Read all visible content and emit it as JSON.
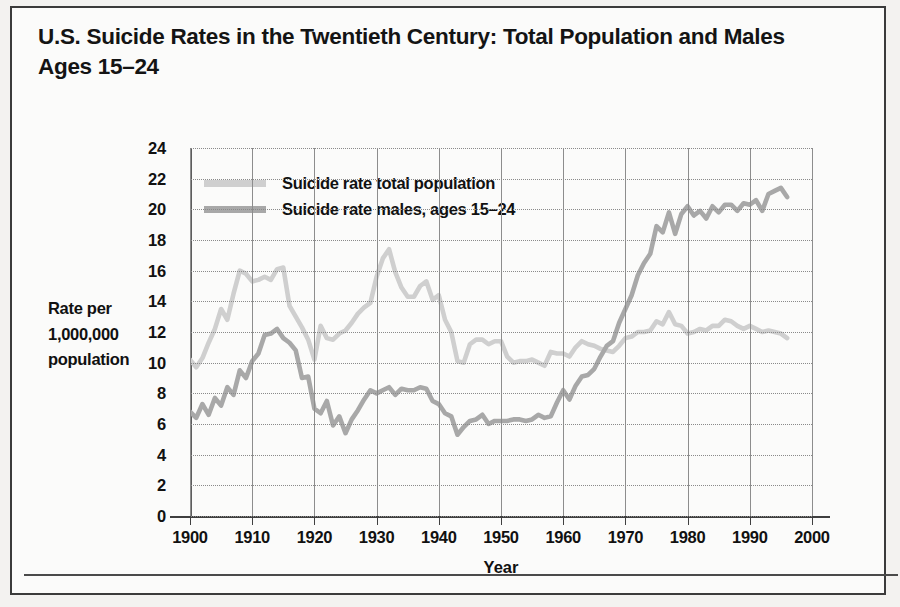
{
  "page": {
    "title": "U.S. Suicide Rates in the Twentieth Century: Total Population and Males Ages 15–24"
  },
  "chart_data": {
    "type": "line",
    "title": "U.S. Suicide Rates in the Twentieth Century: Total Population and Males Ages 15–24",
    "xlabel": "Year",
    "ylabel": "Rate per 1,000,000 population",
    "xlim": [
      1900,
      2000
    ],
    "ylim": [
      0,
      24
    ],
    "xticks": [
      1900,
      1910,
      1920,
      1930,
      1940,
      1950,
      1960,
      1970,
      1980,
      1990,
      2000
    ],
    "yticks": [
      0,
      2,
      4,
      6,
      8,
      10,
      12,
      14,
      16,
      18,
      20,
      22,
      24
    ],
    "grid": "vertical solid, horizontal dotted",
    "legend_position": "top-left inside plot",
    "colors": {
      "total_population": "#cfcfcf",
      "males_15_24": "#a8a8a8",
      "axis": "#3f3f3f",
      "gridline_vertical": "#8d8d8d",
      "gridline_horizontal": "#8a8a8a",
      "text": "#111111",
      "card_background": "#fbfbfa",
      "page_background": "#f3f2f0",
      "border": "#3b3b3b"
    },
    "series": [
      {
        "name": "Suicide rate total population",
        "color": "#cfcfcf",
        "x": [
          1900,
          1901,
          1902,
          1903,
          1904,
          1905,
          1906,
          1907,
          1908,
          1909,
          1910,
          1911,
          1912,
          1913,
          1914,
          1915,
          1916,
          1917,
          1918,
          1919,
          1920,
          1921,
          1922,
          1923,
          1924,
          1925,
          1926,
          1927,
          1928,
          1929,
          1930,
          1931,
          1932,
          1933,
          1934,
          1935,
          1936,
          1937,
          1938,
          1939,
          1940,
          1941,
          1942,
          1943,
          1944,
          1945,
          1946,
          1947,
          1948,
          1949,
          1950,
          1951,
          1952,
          1953,
          1954,
          1955,
          1956,
          1957,
          1958,
          1959,
          1960,
          1961,
          1962,
          1963,
          1964,
          1965,
          1966,
          1967,
          1968,
          1969,
          1970,
          1971,
          1972,
          1973,
          1974,
          1975,
          1976,
          1977,
          1978,
          1979,
          1980,
          1981,
          1982,
          1983,
          1984,
          1985,
          1986,
          1987,
          1988,
          1989,
          1990,
          1991,
          1992,
          1993,
          1994,
          1995,
          1996
        ],
        "y": [
          10.2,
          9.7,
          10.3,
          11.3,
          12.2,
          13.5,
          12.8,
          14.5,
          16.0,
          15.8,
          15.3,
          15.4,
          15.6,
          15.4,
          16.1,
          16.2,
          13.7,
          13.0,
          12.3,
          11.5,
          10.2,
          12.4,
          11.6,
          11.5,
          11.9,
          12.1,
          12.6,
          13.2,
          13.6,
          13.9,
          15.6,
          16.8,
          17.4,
          15.9,
          14.9,
          14.3,
          14.3,
          15.0,
          15.3,
          14.1,
          14.4,
          12.8,
          12.0,
          10.1,
          10.0,
          11.2,
          11.5,
          11.5,
          11.2,
          11.4,
          11.4,
          10.4,
          10.0,
          10.1,
          10.1,
          10.2,
          10.0,
          9.8,
          10.7,
          10.6,
          10.6,
          10.4,
          11.0,
          11.4,
          11.2,
          11.1,
          10.9,
          10.8,
          10.7,
          11.1,
          11.6,
          11.7,
          12.0,
          12.0,
          12.1,
          12.7,
          12.5,
          13.3,
          12.5,
          12.4,
          11.9,
          12.0,
          12.2,
          12.1,
          12.4,
          12.4,
          12.8,
          12.7,
          12.4,
          12.2,
          12.4,
          12.2,
          12.0,
          12.1,
          12.0,
          11.9,
          11.6
        ]
      },
      {
        "name": "Suicide rate males, ages 15–24",
        "color": "#a8a8a8",
        "x": [
          1900,
          1901,
          1902,
          1903,
          1904,
          1905,
          1906,
          1907,
          1908,
          1909,
          1910,
          1911,
          1912,
          1913,
          1914,
          1915,
          1916,
          1917,
          1918,
          1919,
          1920,
          1921,
          1922,
          1923,
          1924,
          1925,
          1926,
          1927,
          1928,
          1929,
          1930,
          1931,
          1932,
          1933,
          1934,
          1935,
          1936,
          1937,
          1938,
          1939,
          1940,
          1941,
          1942,
          1943,
          1944,
          1945,
          1946,
          1947,
          1948,
          1949,
          1950,
          1951,
          1952,
          1953,
          1954,
          1955,
          1956,
          1957,
          1958,
          1959,
          1960,
          1961,
          1962,
          1963,
          1964,
          1965,
          1966,
          1967,
          1968,
          1969,
          1970,
          1971,
          1972,
          1973,
          1974,
          1975,
          1976,
          1977,
          1978,
          1979,
          1980,
          1981,
          1982,
          1983,
          1984,
          1985,
          1986,
          1987,
          1988,
          1989,
          1990,
          1991,
          1992,
          1993,
          1994,
          1995,
          1996
        ],
        "y": [
          6.8,
          6.4,
          7.3,
          6.6,
          7.7,
          7.2,
          8.4,
          7.9,
          9.5,
          9.0,
          10.1,
          10.6,
          11.8,
          11.9,
          12.2,
          11.6,
          11.3,
          10.8,
          9.0,
          9.1,
          7.0,
          6.7,
          7.5,
          5.9,
          6.5,
          5.4,
          6.3,
          6.9,
          7.6,
          8.2,
          8.0,
          8.2,
          8.4,
          7.9,
          8.3,
          8.2,
          8.2,
          8.4,
          8.3,
          7.5,
          7.3,
          6.7,
          6.5,
          5.3,
          5.8,
          6.2,
          6.3,
          6.6,
          6.0,
          6.2,
          6.2,
          6.2,
          6.3,
          6.3,
          6.2,
          6.3,
          6.6,
          6.4,
          6.5,
          7.4,
          8.2,
          7.6,
          8.5,
          9.1,
          9.2,
          9.6,
          10.4,
          11.1,
          11.4,
          12.6,
          13.5,
          14.4,
          15.7,
          16.5,
          17.1,
          18.9,
          18.5,
          19.8,
          18.4,
          19.7,
          20.2,
          19.6,
          19.9,
          19.4,
          20.2,
          19.8,
          20.3,
          20.3,
          19.9,
          20.4,
          20.3,
          20.6,
          19.9,
          21.0,
          21.2,
          21.4,
          20.8
        ]
      }
    ]
  },
  "legend": {
    "items": [
      {
        "label": "Suicide rate total population",
        "color": "#cfcfcf"
      },
      {
        "label": "Suicide rate males, ages 15–24",
        "color": "#a8a8a8"
      }
    ]
  },
  "axes": {
    "y_title_lines": [
      "Rate per",
      "1,000,000",
      "population"
    ],
    "x_title": "Year"
  }
}
